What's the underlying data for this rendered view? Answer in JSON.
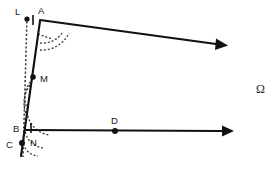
{
  "figure": {
    "background_color": "#ffffff",
    "line_color": "#111111",
    "dash_color": "#3a3a3a",
    "points": [
      {
        "id": "L",
        "label": "L",
        "x": 27,
        "y": 19,
        "label_x": 15,
        "label_y": 12,
        "has_dot": true
      },
      {
        "id": "A",
        "label": "A",
        "x": 40,
        "y": 20,
        "label_x": 39,
        "label_y": 11,
        "has_dot": false
      },
      {
        "id": "M",
        "label": "M",
        "x": 33,
        "y": 77,
        "label_x": 40,
        "label_y": 81,
        "has_dot": true
      },
      {
        "id": "B",
        "label": "B",
        "x": 27,
        "y": 128,
        "label_x": 14,
        "label_y": 131,
        "has_dot": false
      },
      {
        "id": "C",
        "label": "C",
        "x": 22,
        "y": 143,
        "label_x": 7,
        "label_y": 146,
        "has_dot": true
      },
      {
        "id": "D",
        "label": "D",
        "x": 115,
        "y": 131,
        "label_x": 112,
        "label_y": 122,
        "has_dot": true
      },
      {
        "id": "N",
        "label": "N",
        "x": 34,
        "y": 137,
        "label_x": 31,
        "label_y": 144,
        "has_dot": false
      }
    ],
    "symbols": [
      {
        "id": "omega",
        "label": "Ω",
        "x": 261,
        "y": 92
      }
    ],
    "rays": [
      {
        "id": "ray-A",
        "from": "A",
        "x1": 40,
        "y1": 20,
        "x2": 224,
        "y2": 45,
        "arrow": true
      },
      {
        "id": "ray-B",
        "from": "B",
        "x1": 27,
        "y1": 128,
        "x2": 231,
        "y2": 131,
        "arrow": true
      }
    ],
    "segments": [
      {
        "id": "segment-AC",
        "x1": 40,
        "y1": 21,
        "x2": 21,
        "y2": 155
      }
    ],
    "dashed_lines": [
      {
        "id": "transversal-L-C",
        "x1": 27,
        "y1": 19,
        "x2": 23,
        "y2": 156
      }
    ],
    "angle_marks": [
      {
        "id": "angle-at-A",
        "vertex": "A",
        "radius": 30
      },
      {
        "id": "angle-at-M",
        "vertex": "M",
        "radius": 20
      },
      {
        "id": "angle-at-N",
        "vertex": "N",
        "radius": 22
      }
    ],
    "tick_marks": [
      {
        "id": "tick-LA",
        "x": 33,
        "y": 20
      },
      {
        "id": "tick-BN",
        "x": 31,
        "y": 128
      }
    ]
  }
}
